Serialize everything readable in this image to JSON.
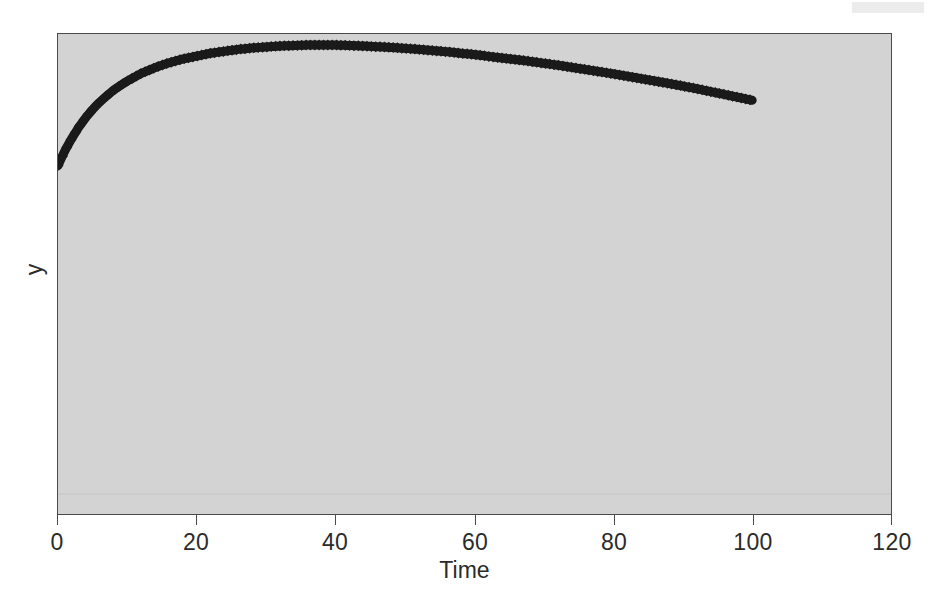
{
  "figure": {
    "background_color": "#ffffff",
    "plot_background_color": "#d3d3d3",
    "border_color": "#4a4a4a",
    "series_color": "#1a1a1a"
  },
  "decorations": {
    "top_right_band_color": "#e9e9e9",
    "baseline_guide_color": "#bdbdbd"
  },
  "axis": {
    "x_title": "Time",
    "y_title": "y",
    "x_ticks": [
      "0",
      "20",
      "40",
      "60",
      "80",
      "100",
      "120"
    ],
    "y_ticks": []
  },
  "chart_data": {
    "type": "line",
    "title": "",
    "xlabel": "Time",
    "ylabel": "y",
    "xlim": [
      0,
      120
    ],
    "ylim": [
      0,
      1
    ],
    "grid": false,
    "legend": null,
    "marker": "diamond",
    "linewidth": 9,
    "xticks": [
      0,
      20,
      40,
      60,
      80,
      100,
      120
    ],
    "yticks": [],
    "series": [
      {
        "name": "y",
        "x": [
          0,
          1,
          2,
          3,
          4,
          5,
          6,
          7,
          8,
          9,
          10,
          12,
          14,
          16,
          18,
          20,
          22,
          24,
          26,
          28,
          30,
          32,
          34,
          36,
          38,
          40,
          44,
          48,
          52,
          56,
          60,
          64,
          68,
          72,
          76,
          80,
          84,
          88,
          92,
          96,
          100
        ],
        "y": [
          0.726,
          0.757,
          0.783,
          0.806,
          0.826,
          0.843,
          0.858,
          0.871,
          0.883,
          0.893,
          0.902,
          0.918,
          0.93,
          0.94,
          0.948,
          0.954,
          0.96,
          0.964,
          0.968,
          0.971,
          0.973,
          0.975,
          0.976,
          0.977,
          0.977,
          0.977,
          0.975,
          0.972,
          0.968,
          0.963,
          0.957,
          0.95,
          0.943,
          0.935,
          0.926,
          0.917,
          0.907,
          0.897,
          0.886,
          0.874,
          0.862
        ]
      }
    ]
  }
}
